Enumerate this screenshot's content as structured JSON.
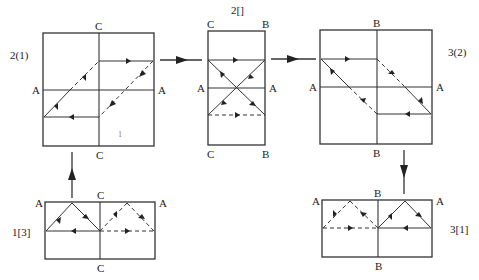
{
  "panels": [
    {
      "id": "2(1)",
      "title": "2(1)",
      "edge_labels": {
        "top": "C",
        "bottom": "C",
        "left": "A",
        "right": "A"
      }
    },
    {
      "id": "2[]",
      "title": "2[]",
      "edge_labels": {
        "top_left": "C",
        "top_right": "B",
        "bottom_left": "C",
        "bottom_right": "B",
        "left": "A",
        "right": "A"
      }
    },
    {
      "id": "3(2)",
      "title": "3(2)",
      "edge_labels": {
        "top": "B",
        "bottom": "B",
        "left": "A",
        "right": "A"
      }
    },
    {
      "id": "1[3]",
      "title": "1[3]",
      "edge_labels": {
        "top": "C",
        "bottom": "C",
        "top_left": "A",
        "top_right": "A"
      }
    },
    {
      "id": "3[1]",
      "title": "3[1]",
      "edge_labels": {
        "top": "B",
        "bottom": "B",
        "top_left": "A",
        "top_right": "A"
      }
    }
  ],
  "flow": [
    "1[3]",
    "2(1)",
    "2[]",
    "3(2)",
    "3[1]"
  ],
  "labels": {
    "p21_title": "2(1)",
    "p21_top": "C",
    "p21_bottom": "C",
    "p21_left": "A",
    "p21_right": "A",
    "p2b_title": "2[]",
    "p2b_tl": "C",
    "p2b_tr": "B",
    "p2b_bl": "C",
    "p2b_br": "B",
    "p2b_left": "A",
    "p2b_right": "A",
    "p32_title": "3(2)",
    "p32_top": "B",
    "p32_bottom": "B",
    "p32_left": "A",
    "p32_right": "A",
    "p13_title": "1[3]",
    "p13_top": "C",
    "p13_bottom": "C",
    "p13_tl": "A",
    "p13_tr": "A",
    "p31_title": "3[1]",
    "p31_top": "B",
    "p31_bottom": "B",
    "p31_tl": "A",
    "p31_tr": "A",
    "stray_mark": "1"
  }
}
